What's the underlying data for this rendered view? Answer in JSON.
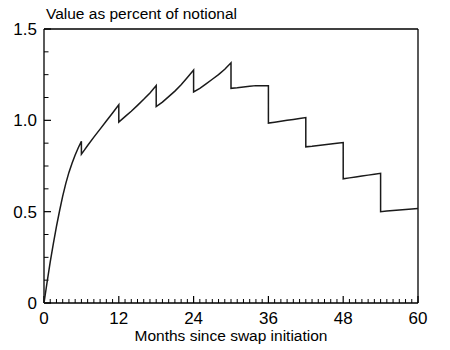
{
  "chart_data": {
    "type": "line",
    "title": "Value as percent of notional",
    "xlabel": "Months since swap initiation",
    "ylabel": "",
    "xlim": [
      0,
      60
    ],
    "ylim": [
      0,
      1.5
    ],
    "grid": false,
    "legend": null,
    "x_ticks": [
      0,
      12,
      24,
      36,
      48,
      60
    ],
    "x_tick_labels": [
      "0",
      "12",
      "24",
      "36",
      "48",
      "60"
    ],
    "x_minor_tick_step": 1,
    "y_ticks": [
      0,
      0.5,
      1.0,
      1.5
    ],
    "y_tick_labels": [
      "0",
      "0.5",
      "1.0",
      "1.5"
    ],
    "y_minor_tick_step": 0.125,
    "series": [
      {
        "name": "Swap value",
        "note": "Sawtooth: concave rise then semiannual payment drops every 6 months",
        "x": [
          0,
          0.5,
          1,
          1.5,
          2,
          2.5,
          3,
          3.5,
          4,
          4.5,
          5,
          5.5,
          6,
          6,
          6.5,
          7,
          8,
          9,
          10,
          11,
          12,
          12,
          13,
          14,
          15,
          16,
          17,
          18,
          18,
          19,
          20,
          21,
          22,
          23,
          24,
          24,
          25,
          26,
          27,
          28,
          29,
          30,
          30,
          31,
          32,
          33,
          34,
          35,
          36,
          36,
          37,
          38,
          39,
          40,
          41,
          42,
          42,
          43,
          44,
          45,
          46,
          47,
          48,
          48,
          49,
          50,
          51,
          52,
          53,
          54,
          54,
          55,
          56,
          57,
          58,
          59,
          60
        ],
        "y": [
          0.0,
          0.115,
          0.225,
          0.325,
          0.42,
          0.505,
          0.585,
          0.655,
          0.715,
          0.765,
          0.81,
          0.85,
          0.885,
          0.815,
          0.838,
          0.862,
          0.908,
          0.952,
          0.996,
          1.04,
          1.085,
          0.99,
          1.02,
          1.05,
          1.082,
          1.115,
          1.15,
          1.19,
          1.075,
          1.1,
          1.13,
          1.16,
          1.195,
          1.235,
          1.275,
          1.155,
          1.175,
          1.2,
          1.225,
          1.25,
          1.28,
          1.315,
          1.175,
          1.178,
          1.182,
          1.186,
          1.19,
          1.19,
          1.19,
          0.985,
          0.99,
          0.995,
          1.0,
          1.005,
          1.01,
          1.015,
          0.855,
          0.858,
          0.862,
          0.866,
          0.87,
          0.874,
          0.878,
          0.68,
          0.685,
          0.69,
          0.695,
          0.7,
          0.705,
          0.71,
          0.5,
          0.503,
          0.506,
          0.509,
          0.512,
          0.515,
          0.518
        ]
      }
    ]
  },
  "plot": {
    "title_text": "Value as percent of notional",
    "xaxis_title": "Months since swap initiation"
  }
}
